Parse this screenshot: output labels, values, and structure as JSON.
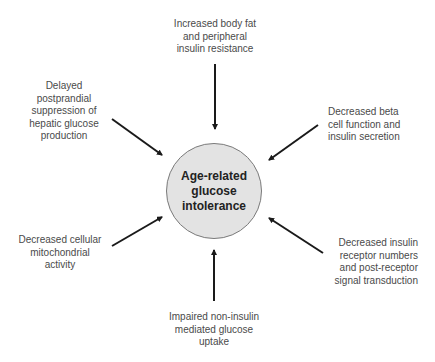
{
  "diagram": {
    "center": {
      "lines": [
        "Age-related",
        "glucose",
        "intolerance"
      ],
      "fill": "#e3e3e3",
      "border": "#7a7a7a"
    },
    "factors": [
      {
        "id": "top",
        "lines": [
          "Increased body fat",
          "and peripheral",
          "insulin resistance"
        ]
      },
      {
        "id": "top-left",
        "lines": [
          "Delayed",
          "postprandial",
          "suppression of",
          "hepatic glucose",
          "production"
        ]
      },
      {
        "id": "top-right",
        "lines": [
          "Decreased beta",
          "cell function and",
          "insulin secretion"
        ]
      },
      {
        "id": "bottom-left",
        "lines": [
          "Decreased cellular",
          "mitochondrial",
          "activity"
        ]
      },
      {
        "id": "bottom-right",
        "lines": [
          "Decreased insulin",
          "receptor numbers",
          "and post-receptor",
          "signal transduction"
        ]
      },
      {
        "id": "bottom",
        "lines": [
          "Impaired non-insulin",
          "mediated glucose",
          "uptake"
        ]
      }
    ],
    "arrow_color": "#1a1a1a",
    "text_color": "#4a4a4a"
  }
}
